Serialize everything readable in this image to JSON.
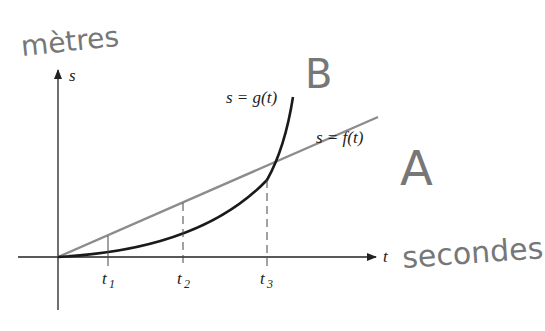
{
  "diagram": {
    "axes": {
      "x_label": "t",
      "y_label": "s",
      "x_ticks": [
        {
          "label": "t",
          "sub": "1"
        },
        {
          "label": "t",
          "sub": "2"
        },
        {
          "label": "t",
          "sub": "3"
        }
      ]
    },
    "curves": {
      "g_label": "s = g(t)",
      "f_label": "s = f(t)"
    },
    "annotations": {
      "y_unit": "mètres",
      "x_unit": "secondes",
      "curve_g_tag": "B",
      "curve_f_tag": "A"
    },
    "colors": {
      "axis": "#222222",
      "f_line": "#8c8c8c",
      "g_curve": "#1a1a1a",
      "handwriting": "#777777"
    }
  }
}
